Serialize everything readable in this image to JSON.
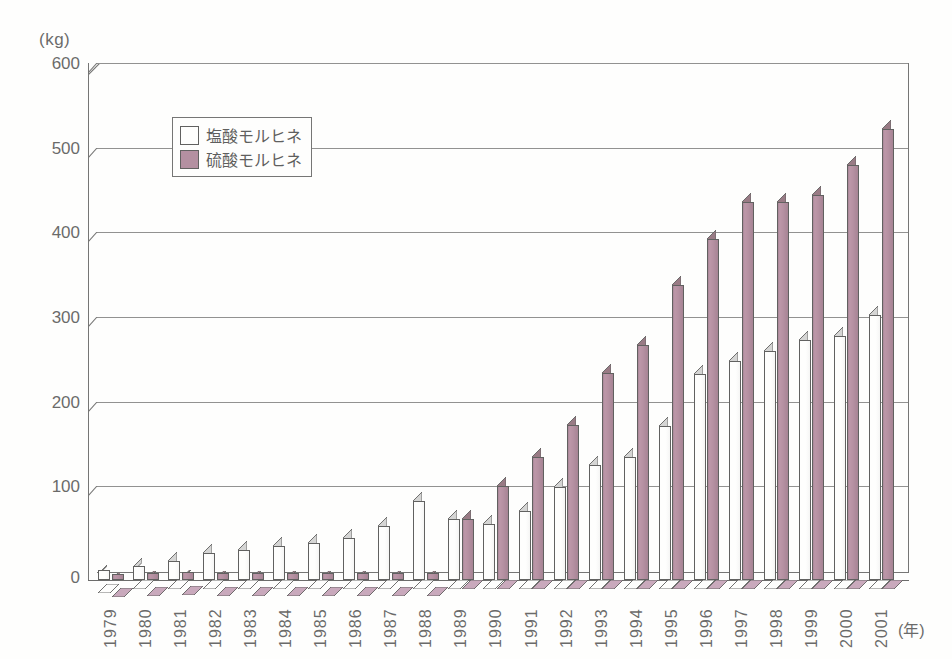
{
  "axes": {
    "y_unit_label": "(kg)",
    "x_unit_label": "(年)",
    "y_ticks": [
      "600",
      "500",
      "400",
      "300",
      "200",
      "100",
      "0"
    ]
  },
  "legend": {
    "items": [
      {
        "label": "塩酸モルヒネ",
        "swatch": "white",
        "color": "#ffffff"
      },
      {
        "label": "硫酸モルヒネ",
        "swatch": "mauve",
        "color": "#9d6c84"
      }
    ]
  },
  "chart_data": {
    "type": "bar",
    "title": "",
    "subtitle": "",
    "xlabel": "(年)",
    "ylabel": "(kg)",
    "ylim": [
      0,
      600
    ],
    "ytick_interval": 100,
    "grid": true,
    "legend_position": "inside-top-left",
    "style": "3d-clustered-column",
    "categories": [
      "1979",
      "1980",
      "1981",
      "1982",
      "1983",
      "1984",
      "1985",
      "1986",
      "1987",
      "1988",
      "1989",
      "1990",
      "1991",
      "1992",
      "1993",
      "1994",
      "1995",
      "1996",
      "1997",
      "1998",
      "1999",
      "2000",
      "2001"
    ],
    "series": [
      {
        "name": "塩酸モルヒネ",
        "color": "#ffffff",
        "values": [
          12,
          16,
          22,
          32,
          36,
          40,
          44,
          50,
          64,
          93,
          72,
          66,
          82,
          110,
          136,
          145,
          182,
          243,
          259,
          271,
          283,
          288,
          313
        ]
      },
      {
        "name": "硫酸モルヒネ",
        "color": "#9d6c84",
        "values": [
          7,
          8,
          9,
          8,
          8,
          8,
          8,
          8,
          8,
          8,
          72,
          111,
          145,
          183,
          245,
          278,
          348,
          403,
          447,
          447,
          455,
          490,
          533
        ]
      }
    ]
  }
}
